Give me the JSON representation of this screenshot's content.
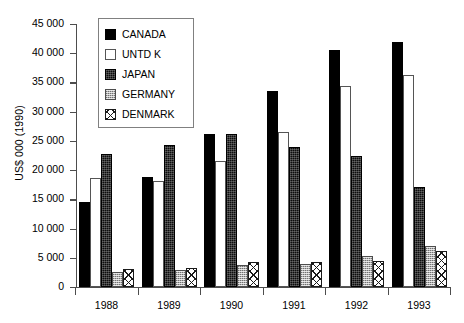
{
  "chart_data": {
    "type": "bar",
    "title": "",
    "subtitle": "",
    "xlabel": "",
    "ylabel": "US$ 000 (1990)",
    "categories": [
      "1988",
      "1989",
      "1990",
      "1991",
      "1992",
      "1993"
    ],
    "ylim": [
      0,
      45000
    ],
    "ytick_labels": [
      "45 000",
      "40 000",
      "35 000",
      "30 000",
      "25 000",
      "20 000",
      "15 000",
      "10 000",
      "5 000",
      "0"
    ],
    "ytick_values": [
      45000,
      40000,
      35000,
      30000,
      25000,
      20000,
      15000,
      10000,
      5000,
      0
    ],
    "ytick_step": 5000,
    "grid": false,
    "legend_position": "top-left-inside",
    "series": [
      {
        "name": "CANADA",
        "swatch": "solid-black",
        "color": "#000000",
        "values": [
          14500,
          18900,
          26200,
          33600,
          40500,
          42000
        ]
      },
      {
        "name": "UNTD K",
        "swatch": "white-outline",
        "color": "#ffffff",
        "values": [
          18700,
          18200,
          21500,
          26600,
          34400,
          36300
        ]
      },
      {
        "name": "JAPAN",
        "swatch": "dark-dither",
        "color": "#0d0d0d",
        "values": [
          22700,
          24300,
          26200,
          23900,
          22500,
          17100
        ]
      },
      {
        "name": "GERMANY",
        "swatch": "gray-dither",
        "color": "#b3b3b3",
        "values": [
          2500,
          2900,
          3800,
          3900,
          5300,
          7000
        ]
      },
      {
        "name": "DENMARK",
        "swatch": "cross-hatch",
        "color": "#ffffff",
        "values": [
          3100,
          3200,
          4300,
          4300,
          4500,
          6200
        ]
      }
    ]
  },
  "legend": {
    "items": [
      {
        "label": "CANADA"
      },
      {
        "label": "UNTD K"
      },
      {
        "label": "JAPAN"
      },
      {
        "label": "GERMANY"
      },
      {
        "label": "DENMARK"
      }
    ]
  }
}
